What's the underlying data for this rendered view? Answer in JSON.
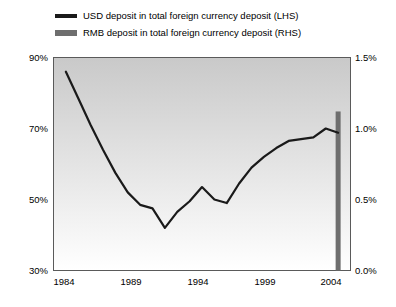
{
  "chart_data": {
    "type": "line",
    "title": "",
    "xlabel": "",
    "ylabel": "",
    "grid": false,
    "legend_position": "top",
    "x_ticks": [
      "1984",
      "1989",
      "1994",
      "1999",
      "2004"
    ],
    "x_tick_values": [
      1984,
      1989,
      1994,
      1999,
      2004
    ],
    "xlim": [
      1983,
      2007
    ],
    "axes": [
      {
        "id": "left",
        "side": "left",
        "label": "",
        "ylim": [
          30,
          90
        ],
        "ticks": [
          30,
          50,
          70,
          90
        ],
        "tick_labels": [
          "30%",
          "50%",
          "70%",
          "90%"
        ]
      },
      {
        "id": "right",
        "side": "right",
        "label": "",
        "ylim": [
          0.0,
          1.5
        ],
        "ticks": [
          0.0,
          0.5,
          1.0,
          1.5
        ],
        "tick_labels": [
          "0.0%",
          "0.5%",
          "1.0%",
          "1.5%"
        ]
      }
    ],
    "series": [
      {
        "name": "USD deposit in total foreign currency deposit (LHS)",
        "type": "line",
        "axis": "left",
        "color": "#1a1a1a",
        "x": [
          1984,
          1985,
          1986,
          1987,
          1988,
          1989,
          1990,
          1991,
          1992,
          1993,
          1994,
          1995,
          1996,
          1997,
          1998,
          1999,
          2000,
          2001,
          2002,
          2003,
          2004,
          2005,
          2006
        ],
        "values": [
          86.0,
          78.5,
          71.0,
          64.0,
          57.5,
          52.0,
          48.5,
          47.5,
          42.0,
          46.5,
          49.5,
          53.5,
          50.0,
          49.0,
          54.5,
          59.0,
          62.0,
          64.5,
          66.5,
          67.0,
          67.5,
          70.0,
          68.8
        ]
      },
      {
        "name": "RMB deposit in total foreign currency deposit (RHS)",
        "type": "bar",
        "axis": "right",
        "color": "#6e6e6e",
        "x": [
          2006
        ],
        "values": [
          1.12
        ]
      }
    ]
  },
  "legend": {
    "items": [
      {
        "label": "USD deposit in total foreign currency deposit (LHS)",
        "color": "#1a1a1a",
        "style": "line"
      },
      {
        "label": "RMB deposit in total foreign currency deposit (RHS)",
        "color": "#6e6e6e",
        "style": "bar"
      }
    ]
  },
  "colors": {
    "line": "#1a1a1a",
    "bar": "#6e6e6e",
    "plot_bg_top": "#c9c9c9",
    "plot_bg_bottom": "#ffffff",
    "axis": "#5a5a5a",
    "text": "#000000"
  }
}
